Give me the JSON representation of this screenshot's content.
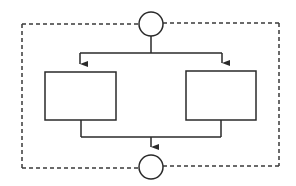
{
  "diagram": {
    "type": "parallel-flow",
    "colors": {
      "background": "#ffffff",
      "stroke": "#2a2a2a",
      "dashed_border": "#3a3a3a"
    },
    "nodes": [
      {
        "id": "start",
        "shape": "circle",
        "label": ""
      },
      {
        "id": "left-process",
        "shape": "rectangle",
        "label": ""
      },
      {
        "id": "right-process",
        "shape": "rectangle",
        "label": ""
      },
      {
        "id": "end",
        "shape": "circle",
        "label": ""
      }
    ],
    "edges": [
      {
        "from": "start",
        "to": "left-process",
        "arrow": true
      },
      {
        "from": "start",
        "to": "right-process",
        "arrow": true
      },
      {
        "from": "left-process",
        "to": "end",
        "arrow": true
      },
      {
        "from": "right-process",
        "to": "end",
        "arrow": true
      }
    ],
    "boundary": {
      "style": "dashed",
      "label": ""
    }
  }
}
